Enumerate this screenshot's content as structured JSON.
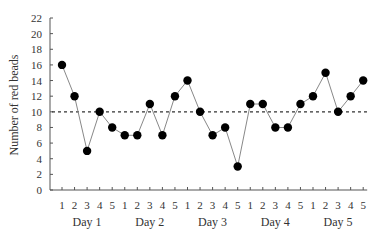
{
  "chart_data": {
    "type": "line",
    "title": "",
    "xlabel": "",
    "ylabel": "Number of red beads",
    "ylim": [
      0,
      22
    ],
    "yticks": [
      0,
      2,
      4,
      6,
      8,
      10,
      12,
      14,
      16,
      18,
      20,
      22
    ],
    "grid": false,
    "legend": null,
    "groups": [
      "Day 1",
      "Day 2",
      "Day 3",
      "Day 4",
      "Day 5"
    ],
    "samples_per_group": [
      "1",
      "2",
      "3",
      "4",
      "5"
    ],
    "categories": [
      "Day 1-1",
      "Day 1-2",
      "Day 1-3",
      "Day 1-4",
      "Day 1-5",
      "Day 2-1",
      "Day 2-2",
      "Day 2-3",
      "Day 2-4",
      "Day 2-5",
      "Day 3-1",
      "Day 3-2",
      "Day 3-3",
      "Day 3-4",
      "Day 3-5",
      "Day 4-1",
      "Day 4-2",
      "Day 4-3",
      "Day 4-4",
      "Day 4-5",
      "Day 5-1",
      "Day 5-2",
      "Day 5-3",
      "Day 5-4",
      "Day 5-5"
    ],
    "series": [
      {
        "name": "Red beads",
        "values": [
          16,
          12,
          5,
          10,
          8,
          7,
          7,
          11,
          7,
          12,
          14,
          10,
          7,
          8,
          3,
          11,
          11,
          8,
          8,
          11,
          12,
          15,
          10,
          12,
          14
        ],
        "marker": "filled-circle",
        "line_color": "#888888",
        "marker_color": "#000000"
      }
    ],
    "reference_lines": [
      {
        "label": "mean",
        "y": 10,
        "style": "dotted",
        "color": "#333333"
      }
    ]
  }
}
